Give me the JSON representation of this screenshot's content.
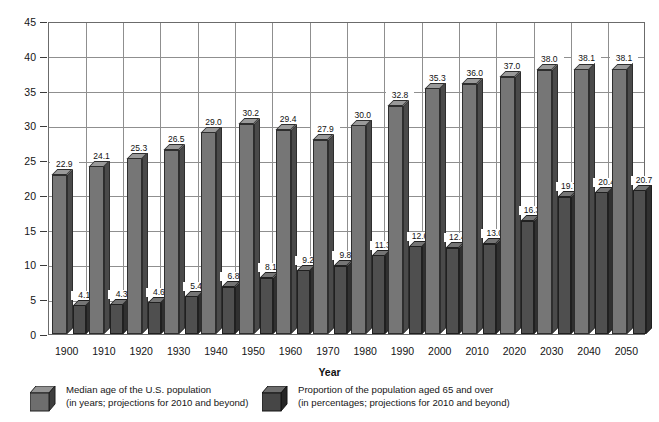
{
  "chart_data": {
    "type": "bar",
    "title": "",
    "subtitle": "",
    "xlabel": "Year",
    "ylabel": "",
    "ylim": [
      0,
      45
    ],
    "ytick_step": 5,
    "yticks": [
      "0",
      "5",
      "10",
      "15",
      "20",
      "25",
      "30",
      "35",
      "40",
      "45"
    ],
    "grid": true,
    "legend_position": "bottom",
    "categories": [
      "1900",
      "1910",
      "1920",
      "1930",
      "1940",
      "1950",
      "1960",
      "1970",
      "1980",
      "1990",
      "2000",
      "2010",
      "2020",
      "2030",
      "2040",
      "2050"
    ],
    "series": [
      {
        "name": "Median age of the U.S. population",
        "units": "years",
        "color": "#767676",
        "values": [
          22.9,
          24.1,
          25.3,
          26.5,
          29.0,
          30.2,
          29.4,
          27.9,
          30.0,
          32.8,
          35.3,
          36.0,
          37.0,
          38.0,
          38.1,
          38.1
        ],
        "labels": [
          "22.9",
          "24.1",
          "25.3",
          "26.5",
          "29.0",
          "30.2",
          "29.4",
          "27.9",
          "30.0",
          "32.8",
          "35.3",
          "36.0",
          "37.0",
          "38.0",
          "38.1",
          "38.1"
        ]
      },
      {
        "name": "Proportion of the population aged 65 and over",
        "units": "percentages",
        "color": "#4f4f4f",
        "values": [
          4.1,
          4.3,
          4.6,
          5.4,
          6.8,
          8.1,
          9.2,
          9.8,
          11.3,
          12.6,
          12.4,
          13.0,
          16.3,
          19.7,
          20.4,
          20.7
        ],
        "labels": [
          "4.1",
          "4.3",
          "4.6",
          "5.4",
          "6.8",
          "8.1",
          "9.2",
          "9.8",
          "11.3",
          "12.6",
          "12.4",
          "13.0",
          "16.3",
          "19.7",
          "20.4",
          "20.7"
        ]
      }
    ]
  },
  "legend": {
    "items": [
      {
        "line1": "Median age of the U.S. population",
        "line2": "(in years; projections for 2010 and beyond)",
        "swatch": "light-gray-cube-icon"
      },
      {
        "line1": "Proportion of the population aged 65 and over",
        "line2": "(in percentages; projections for 2010 and beyond)",
        "swatch": "dark-gray-cube-icon"
      }
    ]
  }
}
